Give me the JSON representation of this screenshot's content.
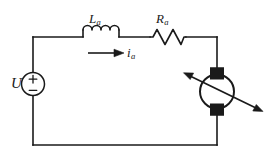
{
  "figure": {
    "stroke_color": "#1a1a1a",
    "background_color": "#ffffff",
    "width": 277,
    "height": 163
  },
  "labels": {
    "source": {
      "symbol": "U",
      "subscript": ""
    },
    "inductor": {
      "symbol": "L",
      "subscript": "a"
    },
    "resistor": {
      "symbol": "R",
      "subscript": "a"
    },
    "current": {
      "symbol": "i",
      "subscript": "a"
    }
  },
  "source_polarity": {
    "positive": "+",
    "negative": "−"
  },
  "components": [
    {
      "name": "voltage-source",
      "type": "dc-source-circle",
      "label": "U"
    },
    {
      "name": "inductor",
      "type": "coil",
      "label": "La"
    },
    {
      "name": "resistor",
      "type": "zigzag",
      "label": "Ra"
    },
    {
      "name": "motor",
      "type": "dc-motor-circle-with-brushes",
      "label": ""
    },
    {
      "name": "current-arrow",
      "type": "arrow-right",
      "label": "ia"
    }
  ]
}
